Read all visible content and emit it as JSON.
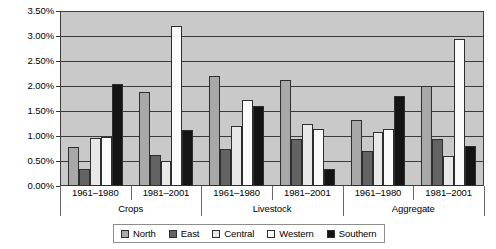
{
  "chart_data": {
    "type": "bar",
    "title": "",
    "subtitle": "",
    "xlabel": "",
    "ylabel": "",
    "grid": true,
    "legend_position": "bottom",
    "ylim": [
      0,
      3.5
    ],
    "ytick_values": [
      0,
      0.5,
      1.0,
      1.5,
      2.0,
      2.5,
      3.0,
      3.5
    ],
    "ytick_labels": [
      "0.00%",
      "0.50%",
      "1.00%",
      "1.50%",
      "2.00%",
      "2.50%",
      "3.00%",
      "3.50%"
    ],
    "group_labels": [
      "Crops",
      "Livestock",
      "Aggregate"
    ],
    "period_labels": [
      "1961–1980",
      "1981–2001"
    ],
    "categories": [
      "Crops 1961–1980",
      "Crops 1981–2001",
      "Livestock 1961–1980",
      "Livestock 1981–2001",
      "Aggregate 1961–1980",
      "Aggregate 1981–2001"
    ],
    "series": [
      {
        "name": "North",
        "color": "#a8a8a8",
        "values": [
          0.78,
          1.88,
          2.2,
          2.12,
          1.32,
          2.0
        ]
      },
      {
        "name": "East",
        "color": "#636363",
        "values": [
          0.35,
          0.62,
          0.75,
          0.95,
          0.7,
          0.95
        ]
      },
      {
        "name": "Central",
        "color": "#e8e8e8",
        "values": [
          0.97,
          0.5,
          1.2,
          1.25,
          1.08,
          0.6
        ]
      },
      {
        "name": "Western",
        "color": "#fbfbfb",
        "values": [
          0.98,
          3.2,
          1.72,
          1.15,
          1.15,
          2.95
        ]
      },
      {
        "name": "Southern",
        "color": "#141414",
        "values": [
          2.05,
          1.12,
          1.6,
          0.35,
          1.8,
          0.8
        ]
      }
    ]
  },
  "legend": {
    "items": [
      {
        "label": "North"
      },
      {
        "label": "East"
      },
      {
        "label": "Central"
      },
      {
        "label": "Western"
      },
      {
        "label": "Southern"
      }
    ]
  }
}
